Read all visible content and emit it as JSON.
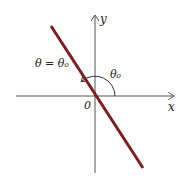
{
  "diagram": {
    "labels": {
      "y_axis": "y",
      "x_axis": "x",
      "origin": "0",
      "line_equation": "θ = θ₀",
      "angle": "θ₀"
    },
    "colors": {
      "line": "#7a1f22",
      "axes": "#555555",
      "arc": "#333333"
    }
  }
}
